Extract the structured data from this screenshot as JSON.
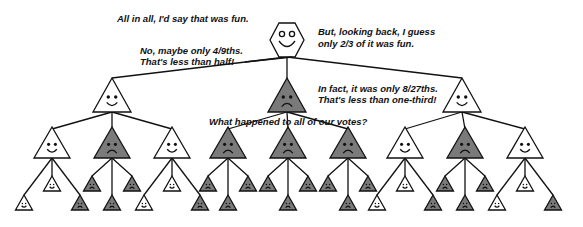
{
  "captions": {
    "root_top": "All in all, I'd say that was fun.",
    "root_right_1": "But, looking back, I guess",
    "root_right_2": "only 2/3 of it was fun.",
    "left_1": "No, maybe only 4/9ths.",
    "left_2": "That's less than half!",
    "mid_1": "In fact, it was only 8/27ths.",
    "mid_2": "That's less than one-third!",
    "bottom": "What happened to all of our votes?"
  },
  "colors": {
    "happy_fill": "#ffffff",
    "sad_fill": "#7a7a7a",
    "line": "#111111"
  },
  "tree": {
    "root": {
      "shape": "hexagon",
      "mood": "happy",
      "x": 287,
      "y": 40
    },
    "level1": [
      {
        "mood": "happy",
        "x": 112,
        "y": 96
      },
      {
        "mood": "sad",
        "x": 287,
        "y": 96
      },
      {
        "mood": "happy",
        "x": 462,
        "y": 96
      }
    ],
    "level2": [
      {
        "mood": "happy",
        "x": 52,
        "parent": 0
      },
      {
        "mood": "sad",
        "x": 112,
        "parent": 0
      },
      {
        "mood": "happy",
        "x": 172,
        "parent": 0
      },
      {
        "mood": "sad",
        "x": 228,
        "parent": 1
      },
      {
        "mood": "sad",
        "x": 288,
        "parent": 1
      },
      {
        "mood": "sad",
        "x": 348,
        "parent": 1
      },
      {
        "mood": "happy",
        "x": 405,
        "parent": 2
      },
      {
        "mood": "sad",
        "x": 465,
        "parent": 2
      },
      {
        "mood": "happy",
        "x": 525,
        "parent": 2
      }
    ],
    "level3": [
      [
        "happy",
        "happy",
        "sad"
      ],
      [
        "sad",
        "sad",
        "sad"
      ],
      [
        "happy",
        "happy",
        "sad"
      ],
      [
        "sad",
        "sad",
        "sad"
      ],
      [
        "sad",
        "sad",
        "sad"
      ],
      [
        "sad",
        "sad",
        "sad"
      ],
      [
        "happy",
        "happy",
        "sad"
      ],
      [
        "sad",
        "sad",
        "sad"
      ],
      [
        "happy",
        "happy",
        "sad"
      ]
    ]
  }
}
